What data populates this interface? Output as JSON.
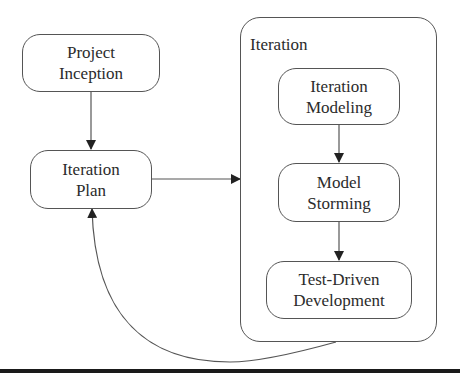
{
  "diagram": {
    "nodes": {
      "project_inception": {
        "line1": "Project",
        "line2": "Inception"
      },
      "iteration_plan": {
        "line1": "Iteration",
        "line2": "Plan"
      },
      "iteration_modeling": {
        "line1": "Iteration",
        "line2": "Modeling"
      },
      "model_storming": {
        "line1": "Model",
        "line2": "Storming"
      },
      "test_driven_development": {
        "line1": "Test-Driven",
        "line2": "Development"
      }
    },
    "container": {
      "label": "Iteration"
    },
    "edges": [
      {
        "from": "Project Inception",
        "to": "Iteration Plan"
      },
      {
        "from": "Iteration Plan",
        "to": "Iteration"
      },
      {
        "from": "Iteration Modeling",
        "to": "Model Storming"
      },
      {
        "from": "Model Storming",
        "to": "Test-Driven Development"
      },
      {
        "from": "Iteration",
        "to": "Iteration Plan"
      }
    ],
    "colors": {
      "line": "#555555",
      "arrowhead": "#222222",
      "text": "#2b2b2b"
    }
  }
}
